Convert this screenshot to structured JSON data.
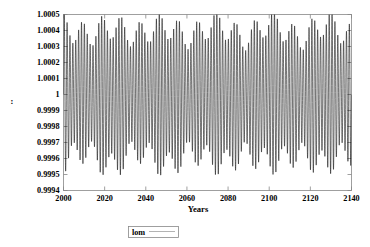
{
  "chart_data": {
    "type": "line",
    "title": "",
    "xlabel": "Years",
    "ylabel": "",
    "xlim": [
      2000,
      2140
    ],
    "ylim": [
      0.9994,
      1.0005
    ],
    "xticks": [
      2000,
      2020,
      2040,
      2060,
      2080,
      2100,
      2120,
      2140
    ],
    "xtick_labels": [
      "2000",
      "2020",
      "2040",
      "2060",
      "2080",
      "2100",
      "2120",
      "2140"
    ],
    "yticks": [
      0.9994,
      0.9995,
      0.9996,
      0.9997,
      0.9998,
      0.9999,
      1,
      1.0001,
      1.0002,
      1.0003,
      1.0004,
      1.0005
    ],
    "ytick_labels": [
      "0.9994",
      "0.9995",
      "0.9996",
      "0.9997",
      "0.9998",
      "0.9999",
      "1",
      "1.0001",
      "1.0002",
      "1.0003",
      "1.0004",
      "1.0005"
    ],
    "grid": false,
    "legend_position": "bottom-center",
    "series": [
      {
        "name": "lom",
        "color": "#000000",
        "description": "Rapidly oscillating length-of-month signal with period near 1.4 years, centre 1.0000, amplitude modulated (beat) between about 0.99945 and 1.00047",
        "carrier_period_years": 1.4,
        "centre": 1.0,
        "base_amplitude": 0.0004,
        "beat_amplitude": 8e-05,
        "beat_period_years": 9.3,
        "secondary_beat_period_years": 26.0,
        "value_min": 0.99945,
        "value_max": 1.00047
      }
    ],
    "legend_entries": [
      "lom"
    ]
  },
  "axes": {
    "x_title": "Years",
    "y_title": ":"
  },
  "legend": {
    "entries": [
      {
        "label": "lom"
      }
    ]
  },
  "colors": {
    "line": "#000000",
    "frame": "#888888",
    "legend_sample": "#aaaaaa",
    "background": "#ffffff",
    "text": "#000000"
  }
}
